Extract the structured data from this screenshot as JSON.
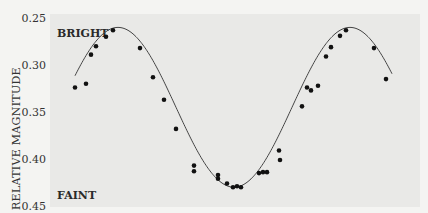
{
  "chart_data": {
    "type": "scatter",
    "title": "",
    "xlabel": "",
    "ylabel": "RELATIVE MAGNITUDE",
    "ylim": [
      0.25,
      0.45
    ],
    "y_inverted": true,
    "yticks": [
      "0.25",
      "0.30",
      "0.35",
      "0.40",
      "0.45"
    ],
    "xticks": [],
    "grid": false,
    "legend": null,
    "annotations": [
      {
        "text": "BRIGHT",
        "position": "top-left"
      },
      {
        "text": "FAINT",
        "position": "bottom-left"
      }
    ],
    "series": [
      {
        "name": "observations",
        "kind": "scatter",
        "x_px": [
          75,
          86,
          91,
          96,
          106,
          113,
          140,
          153,
          164,
          176,
          194,
          194,
          218,
          218,
          227,
          233,
          237,
          241,
          259,
          263,
          267,
          279,
          280,
          302,
          307,
          311,
          318,
          326,
          331,
          340,
          346,
          374,
          386
        ],
        "values": [
          0.324,
          0.32,
          0.289,
          0.28,
          0.27,
          0.263,
          0.282,
          0.313,
          0.337,
          0.368,
          0.407,
          0.413,
          0.417,
          0.421,
          0.426,
          0.43,
          0.429,
          0.43,
          0.415,
          0.414,
          0.414,
          0.391,
          0.401,
          0.344,
          0.324,
          0.327,
          0.322,
          0.291,
          0.281,
          0.269,
          0.263,
          0.282,
          0.315
        ]
      },
      {
        "name": "fitted curve",
        "kind": "line",
        "description": "sinusoidal light curve, max brightness ~0.260, min ~0.430",
        "x_px_range": [
          75,
          392
        ],
        "peaks_px": [
          118,
          350
        ],
        "trough_px": 235,
        "max_mag": 0.26,
        "min_mag": 0.43
      }
    ]
  }
}
